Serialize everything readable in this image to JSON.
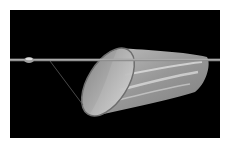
{
  "image": {
    "subject": "Net on a pole against black background",
    "background_color": "#000000",
    "frame_color": "#ffffff",
    "colors": {
      "pole": "#9a9a9a",
      "pole_highlight": "#d0d0d0",
      "net_mesh": "#bdbdbd",
      "net_highlight": "#e6e6e6",
      "rim": "#7a7a7a",
      "string": "#5a5a5a"
    }
  }
}
